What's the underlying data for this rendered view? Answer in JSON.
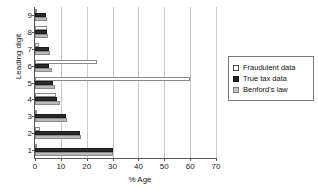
{
  "chart_data": {
    "type": "bar",
    "orientation": "horizontal",
    "title": "",
    "xlabel": "% Age",
    "ylabel": "Leading digit",
    "categories": [
      "1",
      "2",
      "3",
      "4",
      "5",
      "6",
      "7",
      "8",
      "9"
    ],
    "xlim": [
      0,
      70
    ],
    "xticks": [
      0,
      10,
      20,
      30,
      40,
      50,
      60,
      70
    ],
    "grid": "vertical",
    "legend_position": "right",
    "series": [
      {
        "name": "Fraudulent data",
        "color": "#ffffff",
        "values": [
          0.4,
          1.8,
          0.3,
          8.0,
          60.0,
          24.0,
          1.5,
          4.6,
          0.5
        ]
      },
      {
        "name": "True tax data",
        "color": "#2b2b2b",
        "values": [
          30.0,
          17.5,
          12.0,
          8.5,
          7.0,
          5.5,
          5.5,
          4.6,
          4.2
        ]
      },
      {
        "name": "Benford's law",
        "color": "#b9b9b9",
        "values": [
          30.1,
          17.6,
          12.5,
          9.7,
          7.9,
          6.7,
          5.8,
          5.1,
          4.6
        ]
      }
    ]
  },
  "legend": {
    "items": [
      {
        "label": "Fraudulent data",
        "style": "fraud"
      },
      {
        "label": "True tax data",
        "style": "true"
      },
      {
        "label": "Benford's law",
        "style": "benford"
      }
    ]
  }
}
